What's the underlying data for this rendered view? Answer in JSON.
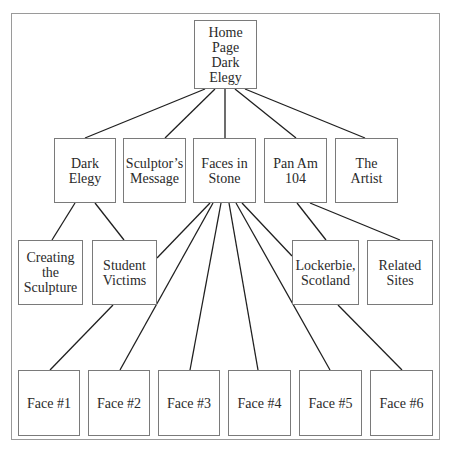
{
  "diagram": {
    "type": "site-map-tree",
    "colors": {
      "background": "#ffffff",
      "box_border": "#7a7a7a",
      "line": "#1f1f1f",
      "frame": "#9a9a9a",
      "text": "#2a2a2a"
    },
    "nodes": [
      {
        "id": "home",
        "label": "Home\nPage\nDark\nElegy",
        "x": 194,
        "y": 20,
        "w": 63,
        "h": 69
      },
      {
        "id": "dark-elegy",
        "label": "Dark\nElegy",
        "x": 54,
        "y": 138,
        "w": 62,
        "h": 65
      },
      {
        "id": "sculptors-message",
        "label": "Sculptor’s\nMessage",
        "x": 123,
        "y": 138,
        "w": 63,
        "h": 65
      },
      {
        "id": "faces-in-stone",
        "label": "Faces in\nStone",
        "x": 193,
        "y": 138,
        "w": 63,
        "h": 65
      },
      {
        "id": "pan-am-104",
        "label": "Pan Am\n104",
        "x": 264,
        "y": 138,
        "w": 63,
        "h": 65
      },
      {
        "id": "the-artist",
        "label": "The\nArtist",
        "x": 335,
        "y": 138,
        "w": 63,
        "h": 65
      },
      {
        "id": "creating-the-sculpture",
        "label": "Creating\nthe\nSculpture",
        "x": 18,
        "y": 240,
        "w": 65,
        "h": 65
      },
      {
        "id": "student-victims",
        "label": "Student\nVictims",
        "x": 92,
        "y": 240,
        "w": 65,
        "h": 65
      },
      {
        "id": "lockerbie-scotland",
        "label": "Lockerbie,\nScotland",
        "x": 292,
        "y": 240,
        "w": 67,
        "h": 65
      },
      {
        "id": "related-sites",
        "label": "Related\nSites",
        "x": 367,
        "y": 240,
        "w": 66,
        "h": 65
      },
      {
        "id": "face-1",
        "label": "Face #1",
        "x": 18,
        "y": 370,
        "w": 62,
        "h": 66
      },
      {
        "id": "face-2",
        "label": "Face #2",
        "x": 88,
        "y": 370,
        "w": 62,
        "h": 66
      },
      {
        "id": "face-3",
        "label": "Face #3",
        "x": 158,
        "y": 370,
        "w": 62,
        "h": 66
      },
      {
        "id": "face-4",
        "label": "Face #4",
        "x": 228,
        "y": 370,
        "w": 63,
        "h": 66
      },
      {
        "id": "face-5",
        "label": "Face #5",
        "x": 299,
        "y": 370,
        "w": 63,
        "h": 66
      },
      {
        "id": "face-6",
        "label": "Face #6",
        "x": 370,
        "y": 370,
        "w": 63,
        "h": 66
      }
    ],
    "edges": [
      {
        "from": "home",
        "to": "dark-elegy",
        "x1": 205,
        "y1": 89,
        "x2": 85,
        "y2": 138
      },
      {
        "from": "home",
        "to": "sculptors-message",
        "x1": 215,
        "y1": 89,
        "x2": 165,
        "y2": 138
      },
      {
        "from": "home",
        "to": "faces-in-stone",
        "x1": 225,
        "y1": 89,
        "x2": 225,
        "y2": 138
      },
      {
        "from": "home",
        "to": "pan-am-104",
        "x1": 235,
        "y1": 89,
        "x2": 296,
        "y2": 138
      },
      {
        "from": "home",
        "to": "the-artist",
        "x1": 245,
        "y1": 89,
        "x2": 365,
        "y2": 138
      },
      {
        "from": "dark-elegy",
        "to": "creating-the-sculpture",
        "x1": 75,
        "y1": 203,
        "x2": 52,
        "y2": 240
      },
      {
        "from": "dark-elegy",
        "to": "student-victims",
        "x1": 95,
        "y1": 203,
        "x2": 124,
        "y2": 240
      },
      {
        "from": "faces-in-stone",
        "to": "student-victims",
        "x1": 210,
        "y1": 203,
        "x2": 157,
        "y2": 258
      },
      {
        "from": "student-victims",
        "to": "face-1",
        "x1": 113,
        "y1": 305,
        "x2": 50,
        "y2": 370
      },
      {
        "from": "faces-in-stone",
        "to": "face-2",
        "x1": 213,
        "y1": 203,
        "x2": 120,
        "y2": 370
      },
      {
        "from": "faces-in-stone",
        "to": "face-3",
        "x1": 221,
        "y1": 203,
        "x2": 190,
        "y2": 370
      },
      {
        "from": "faces-in-stone",
        "to": "face-4",
        "x1": 229,
        "y1": 203,
        "x2": 258,
        "y2": 370
      },
      {
        "from": "faces-in-stone",
        "to": "face-5",
        "x1": 236,
        "y1": 203,
        "x2": 330,
        "y2": 370
      },
      {
        "from": "faces-in-stone",
        "to": "lockerbie-scotland",
        "x1": 242,
        "y1": 203,
        "x2": 292,
        "y2": 256
      },
      {
        "from": "pan-am-104",
        "to": "lockerbie-scotland",
        "x1": 297,
        "y1": 203,
        "x2": 326,
        "y2": 240
      },
      {
        "from": "pan-am-104",
        "to": "related-sites",
        "x1": 310,
        "y1": 203,
        "x2": 400,
        "y2": 240
      },
      {
        "from": "lockerbie-scotland",
        "to": "face-6",
        "x1": 338,
        "y1": 305,
        "x2": 402,
        "y2": 370
      }
    ]
  }
}
